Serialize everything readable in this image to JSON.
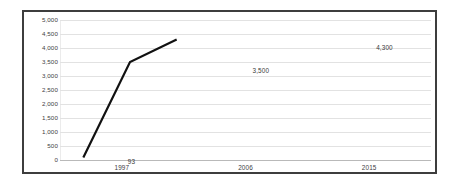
{
  "chart_data": {
    "type": "line",
    "title": "",
    "xlabel": "",
    "ylabel": "",
    "categories": [
      "1997",
      "2006",
      "2015"
    ],
    "values": [
      93,
      3500,
      4300
    ],
    "data_labels": [
      "93",
      "3,500",
      "4,300"
    ],
    "series": [
      {
        "name": "",
        "values": [
          93,
          3500,
          4300
        ]
      }
    ],
    "ylim": [
      0,
      5000
    ],
    "ytick_step": 500,
    "ytick_labels": [
      "5,000",
      "4,500",
      "4,000",
      "3,500",
      "3,000",
      "2,500",
      "2,000",
      "1,500",
      "1,000",
      "500",
      "0"
    ],
    "ytick_values": [
      5000,
      4500,
      4000,
      3500,
      3000,
      2500,
      2000,
      1500,
      1000,
      500,
      0
    ],
    "grid": true,
    "grid_axis": "y",
    "legend": false,
    "legend_position": "none",
    "line_color": "#111111",
    "line_width": 3,
    "grid_color": "#e2e2e2",
    "axis_color": "#b9b9b9",
    "frame_color": "#3d3d3d",
    "background_color": "#ffffff",
    "label_color": "#40403f"
  }
}
